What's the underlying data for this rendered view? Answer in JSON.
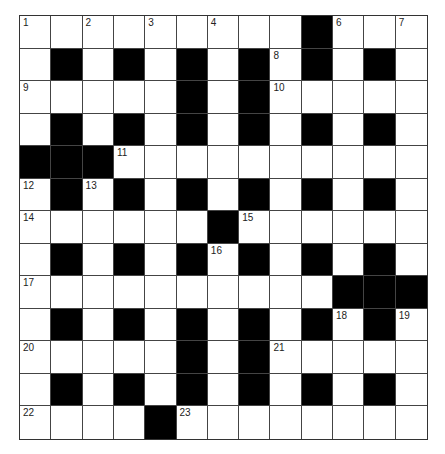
{
  "puzzle": {
    "rows": 13,
    "cols": 13,
    "colors": {
      "black": "#000000",
      "white": "#ffffff",
      "grid_line": "#444444"
    },
    "grid": [
      ".........#...",
      ".#.#.#.#.#.#.",
      ".....#.#.....",
      ".#.#.#.#.#.#.",
      "###..........",
      ".#.#.#.#.#.#.",
      "......#......",
      ".#.#.#.#.#.#.",
      "..........###",
      ".#.#.#.#.#.#.",
      ".....#.#.....",
      ".#.#.#.#.#.#.",
      "....#........"
    ],
    "numbers": [
      {
        "n": "1",
        "r": 0,
        "c": 0
      },
      {
        "n": "2",
        "r": 0,
        "c": 2
      },
      {
        "n": "3",
        "r": 0,
        "c": 4
      },
      {
        "n": "4",
        "r": 0,
        "c": 6
      },
      {
        "n": "5",
        "r": 0,
        "c": 9
      },
      {
        "n": "6",
        "r": 0,
        "c": 10
      },
      {
        "n": "7",
        "r": 0,
        "c": 12
      },
      {
        "n": "8",
        "r": 1,
        "c": 8
      },
      {
        "n": "9",
        "r": 2,
        "c": 0
      },
      {
        "n": "10",
        "r": 2,
        "c": 8
      },
      {
        "n": "11",
        "r": 4,
        "c": 3
      },
      {
        "n": "12",
        "r": 5,
        "c": 0
      },
      {
        "n": "13",
        "r": 5,
        "c": 2
      },
      {
        "n": "14",
        "r": 6,
        "c": 0
      },
      {
        "n": "15",
        "r": 6,
        "c": 7
      },
      {
        "n": "16",
        "r": 7,
        "c": 6
      },
      {
        "n": "17",
        "r": 8,
        "c": 0
      },
      {
        "n": "18",
        "r": 9,
        "c": 10
      },
      {
        "n": "19",
        "r": 9,
        "c": 12
      },
      {
        "n": "20",
        "r": 10,
        "c": 0
      },
      {
        "n": "21",
        "r": 10,
        "c": 8
      },
      {
        "n": "22",
        "r": 12,
        "c": 0
      },
      {
        "n": "23",
        "r": 12,
        "c": 5
      }
    ]
  }
}
